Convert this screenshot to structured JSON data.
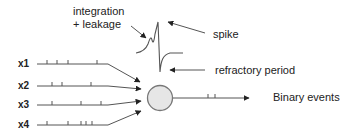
{
  "diagram": {
    "annotations": {
      "integration_line1": "integration",
      "integration_line2": "+ leakage",
      "spike": "spike",
      "refractory": "refractory period",
      "output": "Binary events"
    },
    "inputs": [
      {
        "label": "x1",
        "ticks": [
          47,
          57,
          68,
          97
        ]
      },
      {
        "label": "x2",
        "ticks": [
          52,
          62,
          91
        ]
      },
      {
        "label": "x3",
        "ticks": [
          52,
          81,
          101
        ]
      },
      {
        "label": "x4",
        "ticks": [
          47,
          68,
          81,
          86,
          92
        ]
      }
    ],
    "output_ticks": [
      208,
      215
    ],
    "colors": {
      "line": "#555555",
      "neuron_fill": "#e6e6e6",
      "neuron_stroke": "#777777",
      "arrow": "#222222"
    }
  }
}
